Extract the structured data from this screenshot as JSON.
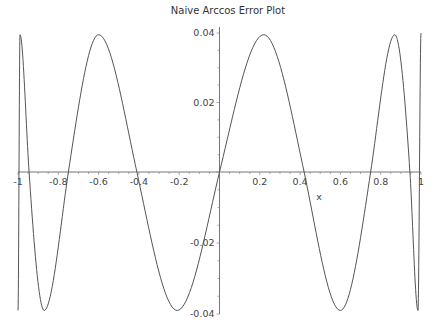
{
  "chart_data": {
    "type": "line",
    "title": "Naive Arccos Error Plot",
    "xlabel": "x",
    "ylabel": "",
    "xlim": [
      -1,
      1
    ],
    "ylim": [
      -0.04,
      0.04
    ],
    "grid": false,
    "legend": null,
    "x_ticks": [
      {
        "value": -1,
        "label": "-1"
      },
      {
        "value": -0.8,
        "label": "-0.8"
      },
      {
        "value": -0.6,
        "label": "-0.6"
      },
      {
        "value": -0.4,
        "label": "-0.4"
      },
      {
        "value": -0.2,
        "label": "-0.2"
      },
      {
        "value": 0.2,
        "label": "0.2"
      },
      {
        "value": 0.4,
        "label": "0.4"
      },
      {
        "value": 0.6,
        "label": "0.6"
      },
      {
        "value": 0.8,
        "label": "0.8"
      },
      {
        "value": 1,
        "label": "1"
      }
    ],
    "y_ticks": [
      {
        "value": 0.04,
        "label": "0.04"
      },
      {
        "value": 0.02,
        "label": "0.02"
      },
      {
        "value": -0.02,
        "label": "-0.02"
      },
      {
        "value": -0.04,
        "label": "-0.04"
      }
    ],
    "series": [
      {
        "name": "error",
        "color": "#555555",
        "x": [
          -1,
          -0.99,
          -0.945,
          -0.87,
          -0.75,
          -0.6,
          -0.41,
          -0.21,
          0,
          0.22,
          0.42,
          0.6,
          0.75,
          0.87,
          0.945,
          0.985,
          1
        ],
        "y": [
          -0.039,
          0.0395,
          0,
          -0.039,
          0,
          0.0395,
          0,
          -0.039,
          0,
          0.0395,
          0,
          -0.039,
          0,
          0.0395,
          0,
          -0.039,
          0.04
        ]
      }
    ]
  }
}
